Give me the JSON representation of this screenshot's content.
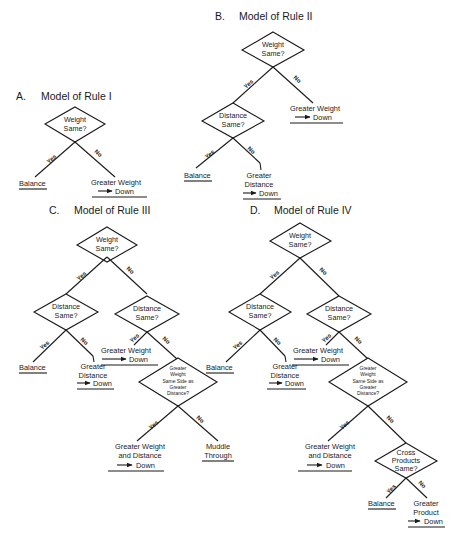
{
  "panels": {
    "A": {
      "letter": "A.",
      "title": "Model of Rule I"
    },
    "B": {
      "letter": "B.",
      "title": "Model of Rule II"
    },
    "C": {
      "letter": "C.",
      "title": "Model of Rule III"
    },
    "D": {
      "letter": "D.",
      "title": "Model of Rule IV"
    }
  },
  "text": {
    "weight_same_1": "Weight",
    "weight_same_2": "Same?",
    "distance_same_1": "Distance",
    "distance_same_2": "Same?",
    "gw_same_side_1": "Greater",
    "gw_same_side_2": "Weight",
    "gw_same_side_3": "Same Side as",
    "gw_same_side_4": "Greater",
    "gw_same_side_5": "Distance?",
    "cross_1": "Cross",
    "cross_2": "Products",
    "cross_3": "Same?",
    "yes": "Yes",
    "no": "No",
    "balance": "Balance",
    "greater_weight": "Greater Weight",
    "greater": "Greater",
    "distance": "Distance",
    "down": "Down",
    "gwd_1": "Greater Weight",
    "gwd_2": "and Distance",
    "muddle": "Muddle",
    "through": "Through",
    "product": "Product"
  }
}
